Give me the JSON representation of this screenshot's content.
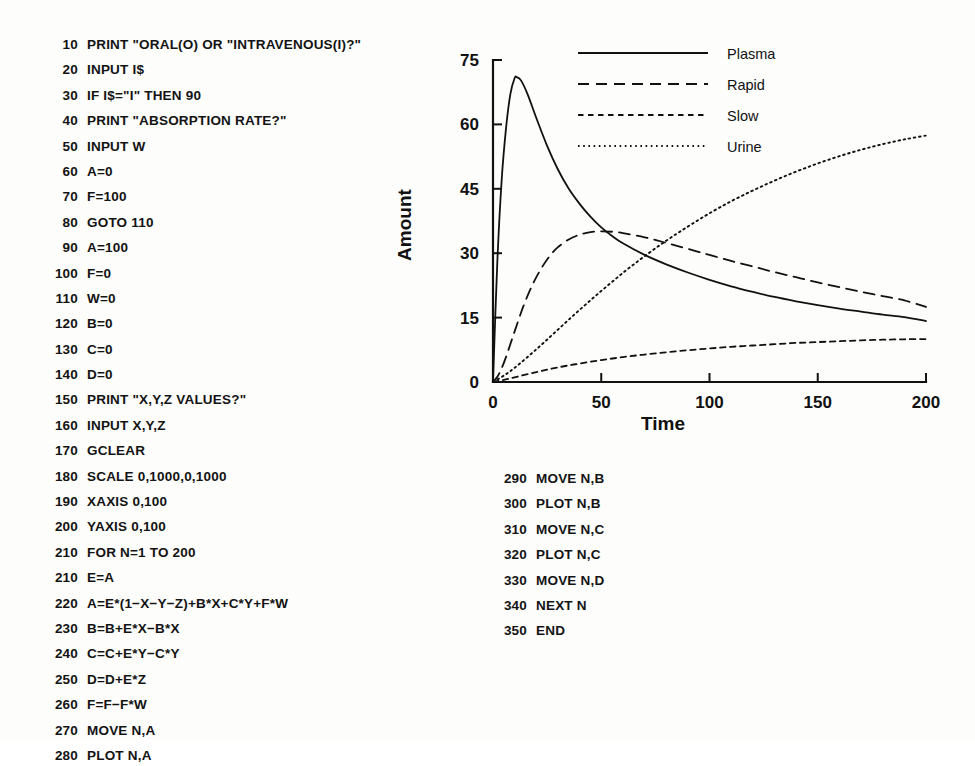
{
  "code_left": {
    "lines": [
      {
        "num": "10",
        "text": "PRINT \"ORAL(O) OR \"INTRAVENOUS(I)?\""
      },
      {
        "num": "20",
        "text": "INPUT I$"
      },
      {
        "num": "30",
        "text": "IF I$=\"I\" THEN 90"
      },
      {
        "num": "40",
        "text": "PRINT \"ABSORPTION RATE?\""
      },
      {
        "num": "50",
        "text": "INPUT W"
      },
      {
        "num": "60",
        "text": "A=0"
      },
      {
        "num": "70",
        "text": "F=100"
      },
      {
        "num": "80",
        "text": "GOTO 110"
      },
      {
        "num": "90",
        "text": "A=100"
      },
      {
        "num": "100",
        "text": "F=0"
      },
      {
        "num": "110",
        "text": "W=0"
      },
      {
        "num": "120",
        "text": "B=0"
      },
      {
        "num": "130",
        "text": "C=0"
      },
      {
        "num": "140",
        "text": "D=0"
      },
      {
        "num": "150",
        "text": "PRINT \"X,Y,Z VALUES?\""
      },
      {
        "num": "160",
        "text": "INPUT X,Y,Z"
      },
      {
        "num": "170",
        "text": "GCLEAR"
      },
      {
        "num": "180",
        "text": "SCALE 0,1000,0,1000"
      },
      {
        "num": "190",
        "text": "XAXIS 0,100"
      },
      {
        "num": "200",
        "text": "YAXIS 0,100"
      },
      {
        "num": "210",
        "text": "FOR N=1 TO 200"
      },
      {
        "num": "210",
        "text": "E=A"
      },
      {
        "num": "220",
        "text": "A=E*(1−X−Y−Z)+B*X+C*Y+F*W"
      },
      {
        "num": "230",
        "text": "B=B+E*X−B*X"
      },
      {
        "num": "240",
        "text": "C=C+E*Y−C*Y"
      },
      {
        "num": "250",
        "text": "D=D+E*Z"
      },
      {
        "num": "260",
        "text": "F=F−F*W"
      },
      {
        "num": "270",
        "text": "MOVE N,A"
      },
      {
        "num": "280",
        "text": "PLOT N,A"
      }
    ]
  },
  "code_right": {
    "lines": [
      {
        "num": "290",
        "text": "MOVE N,B"
      },
      {
        "num": "300",
        "text": "PLOT N,B"
      },
      {
        "num": "310",
        "text": "MOVE N,C"
      },
      {
        "num": "320",
        "text": "PLOT N,C"
      },
      {
        "num": "330",
        "text": "MOVE N,D"
      },
      {
        "num": "340",
        "text": "NEXT N"
      },
      {
        "num": "350",
        "text": "END"
      }
    ]
  },
  "chart_data": {
    "type": "line",
    "title": "",
    "xlabel": "Time",
    "ylabel": "Amount",
    "xlim": [
      0,
      200
    ],
    "ylim": [
      0,
      75
    ],
    "xticks": [
      0,
      50,
      100,
      150,
      200
    ],
    "yticks": [
      0,
      15,
      30,
      45,
      60,
      75
    ],
    "xtick_labels": [
      "0",
      "50",
      "100",
      "150",
      "200"
    ],
    "ytick_labels": [
      "0",
      "15",
      "30",
      "45",
      "60",
      "75"
    ],
    "grid": false,
    "legend_position": "top-right",
    "series": [
      {
        "name": "Plasma",
        "style": "solid",
        "x": [
          0,
          2,
          4,
          6,
          8,
          10,
          11,
          13,
          16,
          20,
          25,
          30,
          35,
          40,
          45,
          50,
          55,
          60,
          70,
          80,
          90,
          100,
          110,
          120,
          130,
          140,
          150,
          160,
          170,
          180,
          190,
          200
        ],
        "y": [
          0,
          28,
          47,
          59,
          67,
          70.8,
          71,
          70.2,
          67,
          61.5,
          55,
          49.5,
          45,
          41.5,
          38.5,
          36,
          34,
          32.3,
          29.6,
          27.4,
          25.5,
          23.8,
          22.3,
          21,
          19.8,
          18.8,
          17.9,
          17.1,
          16.4,
          15.7,
          15.1,
          14.2
        ]
      },
      {
        "name": "Rapid",
        "style": "long-dash",
        "x": [
          0,
          2,
          4,
          6,
          8,
          10,
          14,
          18,
          22,
          26,
          30,
          35,
          40,
          45,
          50,
          55,
          60,
          70,
          80,
          90,
          100,
          110,
          120,
          130,
          140,
          150,
          160,
          170,
          180,
          190,
          200
        ],
        "y": [
          0,
          1.2,
          3.2,
          5.8,
          8.8,
          11.8,
          17.6,
          22.4,
          26.2,
          29.2,
          31.4,
          33.2,
          34.3,
          34.9,
          35.1,
          35.0,
          34.7,
          33.7,
          32.4,
          31.0,
          29.6,
          28.2,
          26.9,
          25.6,
          24.4,
          23.2,
          22.1,
          21.0,
          20.0,
          19.0,
          17.5
        ]
      },
      {
        "name": "Slow",
        "style": "short-dash",
        "x": [
          0,
          5,
          10,
          20,
          30,
          40,
          50,
          60,
          70,
          80,
          90,
          100,
          110,
          120,
          130,
          140,
          150,
          160,
          170,
          180,
          190,
          200
        ],
        "y": [
          0,
          0.5,
          1.1,
          2.3,
          3.4,
          4.3,
          5.1,
          5.8,
          6.4,
          6.9,
          7.4,
          7.8,
          8.2,
          8.5,
          8.8,
          9.1,
          9.3,
          9.5,
          9.7,
          9.85,
          9.95,
          10.0
        ]
      },
      {
        "name": "Urine",
        "style": "dotted",
        "x": [
          0,
          5,
          10,
          20,
          30,
          40,
          50,
          60,
          70,
          80,
          90,
          100,
          110,
          120,
          130,
          140,
          150,
          160,
          170,
          180,
          190,
          200
        ],
        "y": [
          0,
          1.5,
          3.3,
          7.6,
          12.2,
          16.8,
          21.2,
          25.4,
          29.3,
          32.9,
          36.2,
          39.3,
          42.1,
          44.6,
          46.9,
          49.0,
          50.9,
          52.6,
          54.1,
          55.4,
          56.5,
          57.4
        ]
      }
    ]
  }
}
